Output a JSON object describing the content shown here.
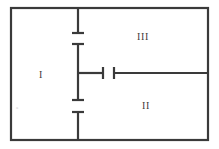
{
  "figure": {
    "width": 219,
    "height": 149,
    "background": "#ffffff",
    "stroke_color": "#3a3a3a",
    "faint_color": "#cfcfcf"
  },
  "frame": {
    "name": "outer-rectangle",
    "x": 11,
    "y": 8,
    "width": 197,
    "height": 132,
    "stroke_width": 2.2
  },
  "labels": {
    "region_1": "I",
    "region_2": "II",
    "region_3": "III",
    "corner_mark": "a"
  },
  "label_positions": {
    "region_1": {
      "x": 41,
      "y": 75
    },
    "region_2": {
      "x": 146,
      "y": 106
    },
    "region_3": {
      "x": 143,
      "y": 37
    },
    "corner_mark": {
      "x": 17,
      "y": 107
    }
  },
  "segments": [
    {
      "name": "upper-vertical-segment",
      "orientation": "vertical",
      "x": 78,
      "y1": 9,
      "y2": 33,
      "cap_start": "none",
      "cap_end": "tee"
    },
    {
      "name": "middle-vertical-segment",
      "orientation": "vertical",
      "x": 78,
      "y1": 44,
      "y2": 100,
      "cap_start": "tee",
      "cap_end": "tee"
    },
    {
      "name": "lower-vertical-segment",
      "orientation": "vertical",
      "x": 78,
      "y1": 112,
      "y2": 139,
      "cap_start": "tee",
      "cap_end": "none"
    },
    {
      "name": "left-horizontal-stub",
      "orientation": "horizontal",
      "y": 73,
      "x1": 78,
      "x2": 103,
      "cap_start": "none",
      "cap_end": "tee"
    },
    {
      "name": "right-horizontal-segment",
      "orientation": "horizontal",
      "y": 73,
      "x1": 114,
      "x2": 207,
      "cap_start": "tee",
      "cap_end": "none"
    }
  ],
  "cap_half_length": 6,
  "stroke_width": 2.2,
  "chart_data": {
    "type": "diagram",
    "title": "",
    "regions": [
      "I",
      "II",
      "III"
    ],
    "gap": {
      "x1": 103,
      "x2": 114,
      "y": 73
    }
  }
}
